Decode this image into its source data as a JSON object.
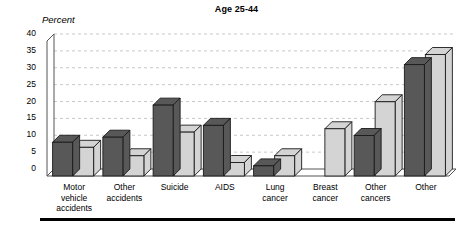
{
  "chart": {
    "title": "Age 25-44",
    "yaxis_unit_label": "Percent"
  },
  "chart_data": {
    "type": "bar",
    "title": "Age 25-44",
    "xlabel": "",
    "ylabel": "Percent",
    "ylim": [
      0,
      40
    ],
    "yticks": [
      0,
      5,
      10,
      15,
      20,
      25,
      30,
      35,
      40
    ],
    "grid": true,
    "legend": "none",
    "categories": [
      "Motor vehicle accidents",
      "Other accidents",
      "Suicide",
      "AIDS",
      "Lung cancer",
      "Breast cancer",
      "Other cancers",
      "Other"
    ],
    "category_lines": [
      [
        "Motor",
        "vehicle",
        "accidents"
      ],
      [
        "Other",
        "accidents"
      ],
      [
        "Suicide"
      ],
      [
        "AIDS"
      ],
      [
        "Lung",
        "cancer"
      ],
      [
        "Breast",
        "cancer"
      ],
      [
        "Other",
        "cancers"
      ],
      [
        "Other"
      ]
    ],
    "series": [
      {
        "name": "dark",
        "color": "#585858",
        "values": [
          10,
          11.5,
          21,
          15,
          3,
          0,
          12,
          33
        ]
      },
      {
        "name": "light",
        "color": "#d4d4d4",
        "values": [
          8.5,
          6,
          13,
          4,
          6,
          14,
          22,
          36
        ]
      }
    ]
  },
  "colors": {
    "dark_bar": "#585858",
    "light_bar": "#d4d4d4",
    "bar_outline": "#1a1a1a",
    "gridline": "#c8c8c8",
    "axis": "#555555",
    "text": "#000000"
  }
}
